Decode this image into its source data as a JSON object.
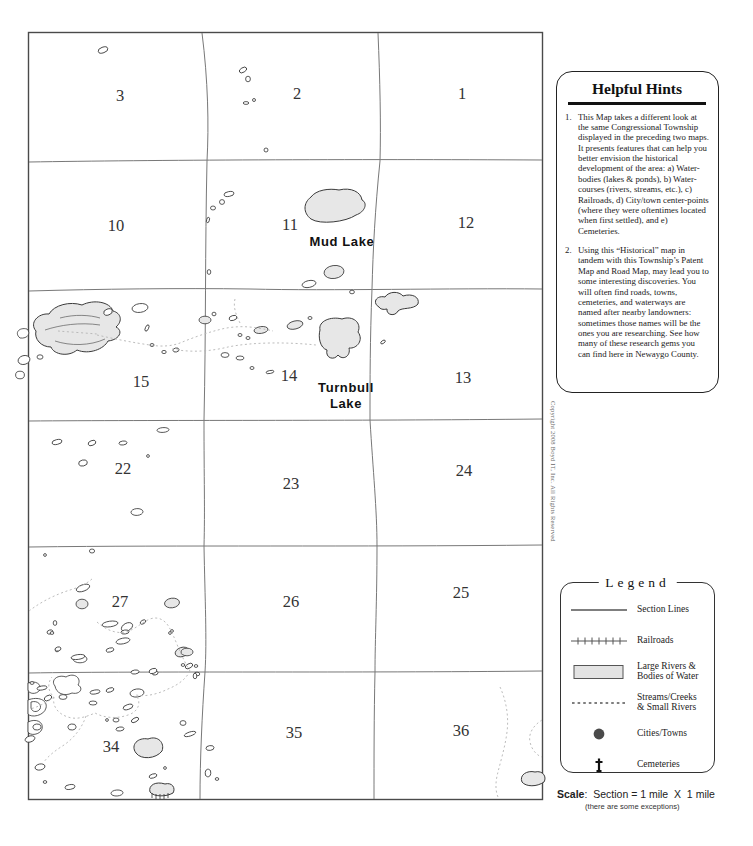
{
  "map": {
    "sections": [
      {
        "n": "3",
        "x": 120,
        "y": 101
      },
      {
        "n": "2",
        "x": 297,
        "y": 99
      },
      {
        "n": "1",
        "x": 462,
        "y": 99
      },
      {
        "n": "10",
        "x": 116,
        "y": 231
      },
      {
        "n": "11",
        "x": 290,
        "y": 230
      },
      {
        "n": "12",
        "x": 466,
        "y": 228
      },
      {
        "n": "15",
        "x": 141,
        "y": 387
      },
      {
        "n": "14",
        "x": 289,
        "y": 381
      },
      {
        "n": "13",
        "x": 463,
        "y": 383
      },
      {
        "n": "22",
        "x": 123,
        "y": 474
      },
      {
        "n": "23",
        "x": 291,
        "y": 489
      },
      {
        "n": "24",
        "x": 464,
        "y": 476
      },
      {
        "n": "27",
        "x": 120,
        "y": 607
      },
      {
        "n": "26",
        "x": 291,
        "y": 607
      },
      {
        "n": "25",
        "x": 461,
        "y": 598
      },
      {
        "n": "34",
        "x": 111,
        "y": 752
      },
      {
        "n": "35",
        "x": 294,
        "y": 738
      },
      {
        "n": "36",
        "x": 461,
        "y": 736
      }
    ],
    "labels": [
      {
        "text": "Mud Lake",
        "x": 342,
        "y": 246
      },
      {
        "text": "Turnbull",
        "x": 346,
        "y": 392
      },
      {
        "text": "Lake",
        "x": 346,
        "y": 408
      }
    ],
    "copyright": "Copyright 2008 Boyd IT, Inc. All Rights Reserved"
  },
  "hints": {
    "title": "Helpful Hints",
    "items": [
      {
        "num": "1.",
        "text": "This Map takes a different look at the same Congressional Township displayed in the preceding two maps.  It presents features that can help you better envision the historical development of the area: a) Water-bodies (lakes & ponds), b) Water-courses (rivers, streams, etc.), c) Railroads, d) City/town center-points (where they were oftentimes located when first settled), and e) Cemeteries."
      },
      {
        "num": "2.",
        "text": "Using this “Historical” map in tandem with this Township’s Patent Map and Road Map, may lead you to some interesting discoveries. You will often find roads, towns, cemeteries, and waterways are named after nearby landowners: sometimes those names will be the ones you are researching. See how many of these research gems you can find here in Newaygo County."
      }
    ]
  },
  "legend": {
    "title": "Legend",
    "items": [
      {
        "name": "section-lines",
        "label": "Section Lines"
      },
      {
        "name": "railroads",
        "label": "Railroads"
      },
      {
        "name": "large-water",
        "label": "Large Rivers &\nBodies of Water"
      },
      {
        "name": "streams",
        "label": "Streams/Creeks\n& Small Rivers"
      },
      {
        "name": "cities-towns",
        "label": "Cities/Towns"
      },
      {
        "name": "cemeteries",
        "label": "Cemeteries"
      }
    ]
  },
  "scale": {
    "label": "Scale",
    "rest": ":  Section = 1 mile  X  1 mile",
    "note": "(there are some exceptions)"
  },
  "colors": {
    "water_fill": "#e7e7e7",
    "grid_line": "#787878",
    "stream_dash": "#b4b4b4",
    "city_dot": "#4a4a4a"
  }
}
